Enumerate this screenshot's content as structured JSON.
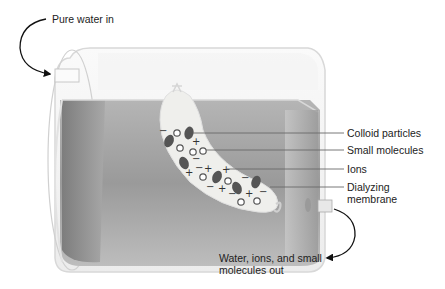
{
  "diagram": {
    "labels": {
      "inlet": "Pure water in",
      "colloid": "Colloid particles",
      "small_molecules": "Small molecules",
      "ions": "Ions",
      "membrane_line1": "Dialyzing",
      "membrane_line2": "membrane",
      "outlet_line1": "Water, ions, and small",
      "outlet_line2": "molecules out"
    },
    "symbols": {
      "positive_ion": "+",
      "negative_ion": "−"
    },
    "colors": {
      "water_dark": "#8a8a8a",
      "water_light": "#c4c4c4",
      "tube_outline": "#d6d6d6",
      "bag_fill": "#f0f0ee",
      "colloid": "#555555",
      "leader_line": "#666666",
      "arrow": "#111111"
    }
  }
}
